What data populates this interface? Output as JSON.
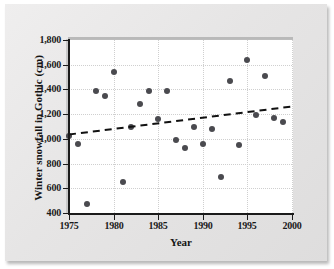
{
  "figure": {
    "background_color": "#e9e9e9",
    "plot_background_color": "#ffffff",
    "point_color": "#4a4a4f",
    "trend_color": "#111111"
  },
  "axis": {
    "x_title": "Year",
    "y_title": "Winter snowfall in Gothic (cm)",
    "x_ticks": [
      "1975",
      "1980",
      "1985",
      "1990",
      "1995",
      "2000"
    ],
    "y_ticks": [
      "1,800",
      "1,600",
      "1,400",
      "1,200",
      "1,000",
      "800",
      "600",
      "400"
    ]
  },
  "chart_data": {
    "type": "scatter",
    "title": "",
    "xlabel": "Year",
    "ylabel": "Winter snowfall in Gothic (cm)",
    "xlim": [
      1975,
      2000
    ],
    "ylim": [
      400,
      1800
    ],
    "xticks": [
      1975,
      1980,
      1985,
      1990,
      1995,
      2000
    ],
    "yticks": [
      400,
      600,
      800,
      1000,
      1200,
      1400,
      1600,
      1800
    ],
    "grid": true,
    "legend": "none",
    "x": [
      1975,
      1976,
      1977,
      1978,
      1979,
      1980,
      1981,
      1982,
      1983,
      1984,
      1985,
      1986,
      1987,
      1988,
      1989,
      1990,
      1991,
      1992,
      1993,
      1994,
      1995,
      1996,
      1997,
      1998,
      1999
    ],
    "y": [
      1020,
      960,
      470,
      1390,
      1350,
      1540,
      650,
      1100,
      1280,
      1390,
      1160,
      1390,
      990,
      930,
      1100,
      960,
      1080,
      690,
      1470,
      950,
      1640,
      1190,
      1510,
      1170,
      1140
    ],
    "points": [
      {
        "year": 1975,
        "snowfall": 1020
      },
      {
        "year": 1976,
        "snowfall": 960
      },
      {
        "year": 1977,
        "snowfall": 470
      },
      {
        "year": 1978,
        "snowfall": 1390
      },
      {
        "year": 1979,
        "snowfall": 1350
      },
      {
        "year": 1980,
        "snowfall": 1540
      },
      {
        "year": 1981,
        "snowfall": 650
      },
      {
        "year": 1982,
        "snowfall": 1100
      },
      {
        "year": 1983,
        "snowfall": 1280
      },
      {
        "year": 1984,
        "snowfall": 1390
      },
      {
        "year": 1985,
        "snowfall": 1160
      },
      {
        "year": 1986,
        "snowfall": 1390
      },
      {
        "year": 1987,
        "snowfall": 990
      },
      {
        "year": 1988,
        "snowfall": 930
      },
      {
        "year": 1989,
        "snowfall": 1100
      },
      {
        "year": 1990,
        "snowfall": 960
      },
      {
        "year": 1991,
        "snowfall": 1080
      },
      {
        "year": 1992,
        "snowfall": 690
      },
      {
        "year": 1993,
        "snowfall": 1470
      },
      {
        "year": 1994,
        "snowfall": 950
      },
      {
        "year": 1995,
        "snowfall": 1640
      },
      {
        "year": 1996,
        "snowfall": 1190
      },
      {
        "year": 1997,
        "snowfall": 1510
      },
      {
        "year": 1998,
        "snowfall": 1170
      },
      {
        "year": 1999,
        "snowfall": 1140
      }
    ],
    "trend_line": {
      "style": "dashed",
      "x_start": 1975,
      "y_start": 1035,
      "x_end": 2000,
      "y_end": 1262
    }
  }
}
